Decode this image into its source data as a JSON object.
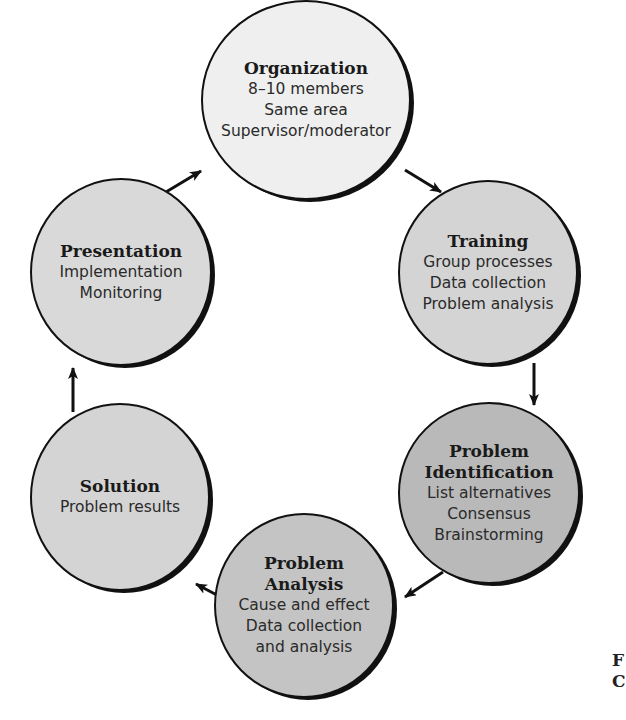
{
  "diagram": {
    "type": "cycle",
    "nodes": [
      {
        "id": "organization",
        "title": "Organization",
        "lines": [
          "8–10 members",
          "Same area",
          "Supervisor/moderator"
        ],
        "fill": "#efefef"
      },
      {
        "id": "training",
        "title": "Training",
        "lines": [
          "Group processes",
          "Data collection",
          "Problem analysis"
        ],
        "fill": "#d4d4d4"
      },
      {
        "id": "problem-identification",
        "title": "Problem Identification",
        "title_lines": [
          "Problem",
          "Identification"
        ],
        "lines": [
          "List alternatives",
          "Consensus",
          "Brainstorming"
        ],
        "fill": "#b9b9b9"
      },
      {
        "id": "problem-analysis",
        "title": "Problem Analysis",
        "title_lines": [
          "Problem",
          "Analysis"
        ],
        "lines": [
          "Cause and effect",
          "Data collection",
          "and analysis"
        ],
        "fill": "#c4c4c4"
      },
      {
        "id": "solution",
        "title": "Solution",
        "lines": [
          "Problem results"
        ],
        "fill": "#d4d4d4"
      },
      {
        "id": "presentation",
        "title": "Presentation",
        "lines": [
          "Implementation",
          "Monitoring"
        ],
        "fill": "#d9d9d9"
      }
    ],
    "edges": [
      {
        "from": "organization",
        "to": "training"
      },
      {
        "from": "training",
        "to": "problem-identification"
      },
      {
        "from": "problem-identification",
        "to": "problem-analysis"
      },
      {
        "from": "problem-analysis",
        "to": "solution"
      },
      {
        "from": "solution",
        "to": "presentation"
      },
      {
        "from": "presentation",
        "to": "organization"
      }
    ],
    "corner_fragment": [
      "F",
      "C"
    ]
  }
}
